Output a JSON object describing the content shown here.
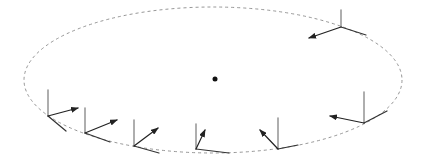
{
  "diagram": {
    "type": "orbit-frames",
    "width": 423,
    "height": 163,
    "colors": {
      "background": "#ffffff",
      "orbit": "#8a8a8a",
      "vertical_axis": "#9a9a9a",
      "arrow_axis": "#222222",
      "third_axis": "#333333",
      "center": "#111111"
    },
    "orbit": {
      "cx": 213,
      "cy": 80,
      "rx": 189,
      "ry": 73,
      "style": "dashed"
    },
    "center": {
      "x": 215,
      "y": 79,
      "r": 2.5
    },
    "frames": [
      {
        "id": "frame-1",
        "origin": [
          48,
          116
        ],
        "vertical": [
          48,
          90
        ],
        "arrow": [
          78,
          108
        ],
        "third": [
          66,
          131
        ]
      },
      {
        "id": "frame-2",
        "origin": [
          85,
          133
        ],
        "vertical": [
          85,
          108
        ],
        "arrow": [
          117,
          120
        ],
        "third": [
          110,
          142
        ]
      },
      {
        "id": "frame-3",
        "origin": [
          134,
          146
        ],
        "vertical": [
          134,
          120
        ],
        "arrow": [
          158,
          128
        ],
        "third": [
          159,
          153
        ]
      },
      {
        "id": "frame-4",
        "origin": [
          196,
          149
        ],
        "vertical": [
          196,
          124
        ],
        "arrow": [
          205,
          130
        ],
        "third": [
          229,
          153
        ]
      },
      {
        "id": "frame-5",
        "origin": [
          278,
          149
        ],
        "vertical": [
          278,
          118
        ],
        "arrow": [
          260,
          130
        ],
        "third": [
          298,
          145
        ]
      },
      {
        "id": "frame-6",
        "origin": [
          364,
          123
        ],
        "vertical": [
          364,
          92
        ],
        "arrow": [
          330,
          116
        ],
        "third": [
          387,
          111
        ]
      },
      {
        "id": "frame-7",
        "origin": [
          341,
          27
        ],
        "vertical": [
          341,
          10
        ],
        "arrow": [
          309,
          38
        ],
        "third": [
          366,
          35
        ]
      }
    ]
  }
}
